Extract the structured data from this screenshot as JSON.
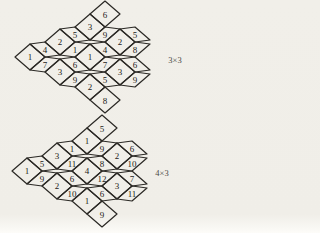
{
  "canvas": {
    "width": 184,
    "height": 233,
    "background": "#f1efe9",
    "line_color": "#2b2925",
    "number_color": "#1c1b18",
    "caption_color": "#4b4a45",
    "line_width": 1.2
  },
  "figures": [
    {
      "id": "3x3",
      "caption": "3×3",
      "caption_x": 175,
      "caption_y": 63,
      "hexagons": [
        {
          "x": 105,
          "y": 27,
          "w": "3",
          "ne": "6",
          "se": "9",
          "ne_fat": true
        },
        {
          "x": 75,
          "y": 42,
          "w": "2",
          "ne": "5",
          "se": "1"
        },
        {
          "x": 135,
          "y": 42,
          "w": "2",
          "ne": "5",
          "se": "8"
        },
        {
          "x": 45,
          "y": 57,
          "w": "1",
          "ne": "4",
          "se": "7"
        },
        {
          "x": 105,
          "y": 57,
          "w": "1",
          "ne": "4",
          "se": "7"
        },
        {
          "x": 75,
          "y": 72,
          "w": "3",
          "ne": "6",
          "se": "9"
        },
        {
          "x": 135,
          "y": 72,
          "w": "3",
          "ne": "6",
          "se": "9"
        },
        {
          "x": 105,
          "y": 87,
          "w": "2",
          "ne": "5",
          "se": "8",
          "se_fat": true
        }
      ]
    },
    {
      "id": "4x3",
      "caption": "4×3",
      "caption_x": 162,
      "caption_y": 176,
      "hexagons": [
        {
          "x": 102,
          "y": 141,
          "w": "1",
          "ne": "5",
          "se": "9",
          "ne_fat": true
        },
        {
          "x": 72,
          "y": 156,
          "w": "3",
          "ne": "1",
          "se": "11"
        },
        {
          "x": 132,
          "y": 156,
          "w": "2",
          "ne": "6",
          "se": "10"
        },
        {
          "x": 42,
          "y": 171,
          "w": "1",
          "ne": "5",
          "se": "9"
        },
        {
          "x": 102,
          "y": 171,
          "w": "4",
          "ne": "8",
          "se": "12"
        },
        {
          "x": 72,
          "y": 186,
          "w": "2",
          "ne": "6",
          "se": "10"
        },
        {
          "x": 132,
          "y": 186,
          "w": "3",
          "ne": "7",
          "se": "11"
        },
        {
          "x": 102,
          "y": 201,
          "w": "1",
          "ne": "6",
          "se": "9",
          "se_fat": true
        }
      ]
    }
  ]
}
